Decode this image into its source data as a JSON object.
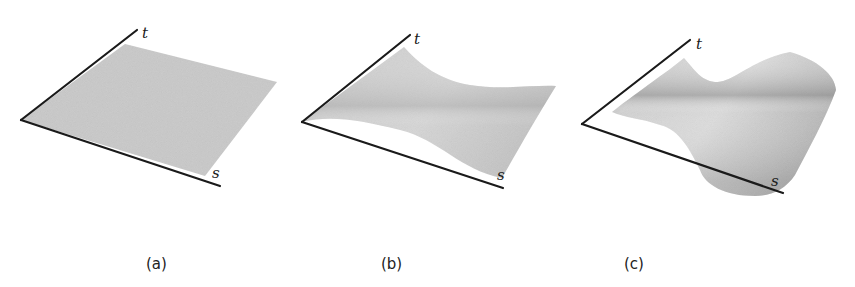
{
  "figure": {
    "panels": [
      {
        "id": "a",
        "caption": "(a)",
        "description": "flat surface",
        "axis_t": "t",
        "axis_s": "s"
      },
      {
        "id": "b",
        "caption": "(b)",
        "description": "saddle-like curved surface",
        "axis_t": "t",
        "axis_s": "s"
      },
      {
        "id": "c",
        "caption": "(c)",
        "description": "strongly warped surface",
        "axis_t": "t",
        "axis_s": "s"
      }
    ],
    "colors": {
      "surface": "#c8c8c8",
      "axis": "#1a1a1a",
      "background": "#ffffff"
    }
  }
}
